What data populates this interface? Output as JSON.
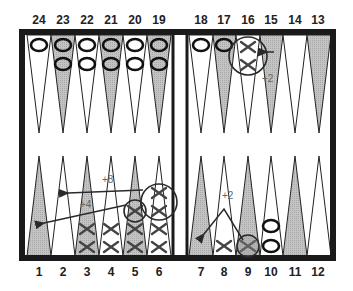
{
  "board": {
    "title": "Backgammon position diagram",
    "colors": {
      "frame": "#1a1a1a",
      "shaded_point": "#b8b8b8",
      "light_point": "#ffffff",
      "ink": "#2a2a2a",
      "annotation": "#666666"
    },
    "top_labels": [
      "24",
      "23",
      "22",
      "21",
      "20",
      "19",
      "18",
      "17",
      "16",
      "15",
      "14",
      "13"
    ],
    "bottom_labels": [
      "1",
      "2",
      "3",
      "4",
      "5",
      "6",
      "7",
      "8",
      "9",
      "10",
      "11",
      "12"
    ],
    "points": [
      {
        "point": 1,
        "checkers": 0,
        "type": ""
      },
      {
        "point": 2,
        "checkers": 0,
        "type": ""
      },
      {
        "point": 3,
        "checkers": 2,
        "type": "X"
      },
      {
        "point": 4,
        "checkers": 2,
        "type": "X"
      },
      {
        "point": 5,
        "checkers": 3,
        "type": "X",
        "circled_top": 1
      },
      {
        "point": 6,
        "checkers": 4,
        "type": "X",
        "circled_top": 2
      },
      {
        "point": 7,
        "checkers": 0,
        "type": ""
      },
      {
        "point": 8,
        "checkers": 1,
        "type": "X"
      },
      {
        "point": 9,
        "checkers": 1,
        "type": "X",
        "circled_top": 1
      },
      {
        "point": 10,
        "checkers": 2,
        "type": "O"
      },
      {
        "point": 11,
        "checkers": 0,
        "type": ""
      },
      {
        "point": 12,
        "checkers": 0,
        "type": ""
      },
      {
        "point": 13,
        "checkers": 0,
        "type": ""
      },
      {
        "point": 14,
        "checkers": 0,
        "type": ""
      },
      {
        "point": 15,
        "checkers": 0,
        "type": ""
      },
      {
        "point": 16,
        "checkers": 2,
        "type": "X",
        "circled_top": 2
      },
      {
        "point": 17,
        "checkers": 1,
        "type": "O"
      },
      {
        "point": 18,
        "checkers": 1,
        "type": "O"
      },
      {
        "point": 19,
        "checkers": 2,
        "type": "O"
      },
      {
        "point": 20,
        "checkers": 2,
        "type": "O"
      },
      {
        "point": 21,
        "checkers": 2,
        "type": "O"
      },
      {
        "point": 22,
        "checkers": 2,
        "type": "O"
      },
      {
        "point": 23,
        "checkers": 2,
        "type": "O"
      },
      {
        "point": 24,
        "checkers": 1,
        "type": "O"
      }
    ],
    "moves": [
      {
        "from": 6,
        "to": 2,
        "label": "+8"
      },
      {
        "from": 5,
        "to": 1,
        "label": "+4"
      },
      {
        "from": 9,
        "to": 7,
        "label": "+2"
      },
      {
        "from": 16,
        "to": 15,
        "label": "+2"
      }
    ]
  }
}
